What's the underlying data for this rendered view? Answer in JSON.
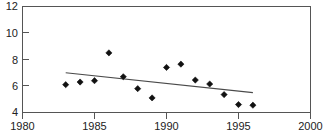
{
  "chart_data": {
    "type": "scatter",
    "title": "",
    "xlabel": "",
    "ylabel": "",
    "xlim": [
      1980,
      2000
    ],
    "ylim": [
      4,
      12
    ],
    "xticks": [
      1980,
      1985,
      1990,
      1995,
      2000
    ],
    "yticks": [
      4,
      6,
      8,
      10,
      12
    ],
    "grid": false,
    "legend": null,
    "x": [
      1983,
      1984,
      1985,
      1986,
      1987,
      1988,
      1989,
      1990,
      1991,
      1992,
      1993,
      1994,
      1995,
      1996
    ],
    "values": [
      6.1,
      6.3,
      6.4,
      8.5,
      6.7,
      5.8,
      5.1,
      7.4,
      7.65,
      6.45,
      6.15,
      5.35,
      4.6,
      4.55
    ],
    "series": [
      {
        "name": "observations",
        "marker": "diamond",
        "color": "#111111",
        "x": [
          1983,
          1984,
          1985,
          1986,
          1987,
          1988,
          1989,
          1990,
          1991,
          1992,
          1993,
          1994,
          1995,
          1996
        ],
        "values": [
          6.1,
          6.3,
          6.4,
          8.5,
          6.7,
          5.8,
          5.1,
          7.4,
          7.65,
          6.45,
          6.15,
          5.35,
          4.6,
          4.55
        ]
      },
      {
        "name": "trend-line",
        "marker": "none",
        "color": "#4a4a4a",
        "x": [
          1983,
          1996
        ],
        "values": [
          7.0,
          5.5
        ]
      }
    ],
    "annotations": []
  },
  "axes": {
    "y_tick_labels": [
      "12",
      "10",
      "8",
      "6",
      "4"
    ],
    "x_tick_labels": [
      "1980",
      "1985",
      "1990",
      "1995",
      "2000"
    ]
  },
  "cropped_header": {
    "text": ""
  }
}
